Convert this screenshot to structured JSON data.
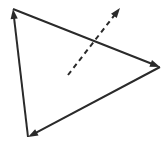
{
  "figure": {
    "background_color": "#ffffff",
    "canvas": {
      "width": 167,
      "height": 147
    }
  },
  "style": {
    "stroke_color": "#2a2a2a",
    "solid_stroke_width": 2,
    "dashed_stroke_width": 2,
    "dash_pattern": "5,4",
    "arrowhead_length": 10,
    "arrowhead_half_width": 3.6
  },
  "chart_data": {
    "type": "diagram",
    "grid": false,
    "legend": false,
    "xlabel": "",
    "ylabel": "",
    "xlim": [
      0,
      167
    ],
    "ylim": [
      0,
      147
    ],
    "vertices": [
      {
        "id": "A",
        "label": "",
        "x": 13,
        "y": 9
      },
      {
        "id": "B",
        "label": "",
        "x": 160,
        "y": 67
      },
      {
        "id": "C",
        "label": "",
        "x": 28,
        "y": 137
      }
    ],
    "edges": [
      {
        "id": "edge-top",
        "from": "A",
        "to": "B",
        "style": "solid",
        "arrow_at": "to",
        "x1": 13,
        "y1": 9,
        "x2": 160,
        "y2": 67
      },
      {
        "id": "edge-right",
        "from": "B",
        "to": "C",
        "style": "solid",
        "arrow_at": "to",
        "x1": 160,
        "y1": 67,
        "x2": 28,
        "y2": 137
      },
      {
        "id": "edge-left",
        "from": "C",
        "to": "A",
        "style": "solid",
        "arrow_at": "to",
        "x1": 28,
        "y1": 137,
        "x2": 13,
        "y2": 9
      }
    ],
    "vectors": [
      {
        "id": "dashed-arrow",
        "style": "dashed",
        "arrow_at": "to",
        "x1": 68,
        "y1": 75,
        "x2": 120,
        "y2": 8,
        "label": ""
      }
    ],
    "annotations": []
  }
}
